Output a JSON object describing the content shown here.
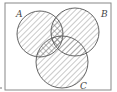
{
  "diagram": {
    "type": "venn",
    "universe_frame": true,
    "sets": [
      {
        "label": "A",
        "cx": 40,
        "cy": 34,
        "r": 23
      },
      {
        "label": "B",
        "cx": 75,
        "cy": 32,
        "r": 24
      },
      {
        "label": "C",
        "cx": 62,
        "cy": 62,
        "r": 26
      }
    ],
    "shading": {
      "single_hatch": "each circle (A, B, C)",
      "cross_hatch": [
        "A∩B",
        "A∩C"
      ]
    },
    "colors": {
      "stroke": "#555555",
      "hatch": "#777777",
      "frame": "#888888"
    }
  }
}
